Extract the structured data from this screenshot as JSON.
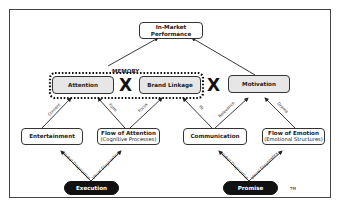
{
  "diagram": {
    "top_node": {
      "line1": "In-Market",
      "line2": "Performance"
    },
    "memory_label": "MEMORY",
    "multiply_symbol": "X",
    "middle_nodes": [
      {
        "label": "Attention"
      },
      {
        "label": "Brand Linkage"
      },
      {
        "label": "Motivation"
      }
    ],
    "lower_nodes": [
      {
        "label": "Entertainment",
        "sub": ""
      },
      {
        "label": "Flow of Attention",
        "sub": "(Cognitive Processes)"
      },
      {
        "label": "Communication",
        "sub": ""
      },
      {
        "label": "Flow of Emotion",
        "sub": "(Emotional Structures)"
      }
    ],
    "bottom_nodes": [
      {
        "label": "Execution"
      },
      {
        "label": "Promise"
      }
    ],
    "edge_labels": {
      "content": "Content",
      "form": "Form",
      "focus": "Focus",
      "fit": "Fit",
      "relevance": "Relevance",
      "drama": "Drama",
      "verbal_diagnostics_1": "Verbal Diagnostics",
      "visual_diagnostics_1": "Visual Diagnostics",
      "verbal_diagnostics_2": "Verbal Diagnostics",
      "visual_diagnostics_2": "Visual Diagnostics"
    },
    "trademark": "TM"
  }
}
